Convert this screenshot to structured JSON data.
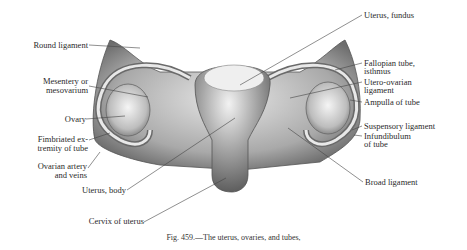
{
  "figure": {
    "caption": "Fig. 459.—The uterus, ovaries, and tubes,",
    "labels_left": {
      "round_ligament": "Round ligament",
      "mesentery_1": "Mesentery or",
      "mesentery_2": "mesovarium",
      "ovary": "Ovary",
      "fimbriated_1": "Fimbriated ex-",
      "fimbriated_2": "tremity of tube",
      "ovarian_artery_1": "Ovarian artery",
      "ovarian_artery_2": "and veins",
      "uterus_body": "Uterus, body",
      "cervix": "Cervix of uterus"
    },
    "labels_right": {
      "uterus_fundus": "Uterus, fundus",
      "fallopian_1": "Fallopian tube,",
      "fallopian_2": "isthmus",
      "utero_ovarian_1": "Utero-ovarian",
      "utero_ovarian_2": "ligament",
      "ampulla": "Ampulla of tube",
      "suspensory": "Suspensory ligament",
      "infundibulum_1": "Infundibulum",
      "infundibulum_2": "of tube",
      "broad_ligament": "Broad ligament"
    }
  }
}
